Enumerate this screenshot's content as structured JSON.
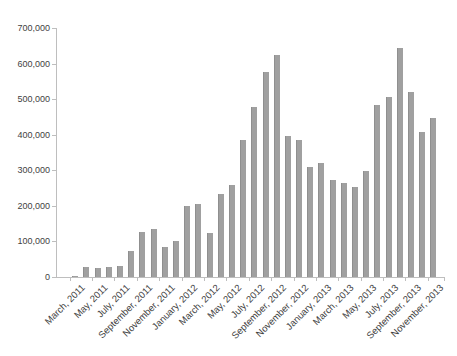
{
  "figure": {
    "background_color": "#ffffff",
    "bar_color": "#a0a0a0",
    "bar_border_color": "#8f8f8f",
    "axis_line_color": "#bebebe",
    "label_color": "#3f3f3f"
  },
  "chart_data": {
    "type": "bar",
    "title": "",
    "xlabel": "",
    "ylabel": "",
    "ylim": [
      0,
      700000
    ],
    "y_tick_interval": 100000,
    "y_tick_labels": [
      "0",
      "100,000",
      "200,000",
      "300,000",
      "400,000",
      "500,000",
      "600,000",
      "700,000"
    ],
    "grid": false,
    "legend": false,
    "x_label_every_n": 2,
    "x_labels_rotation_deg": 45,
    "visible_x_tick_labels": [
      "March, 2011",
      "May, 2011",
      "July, 2011",
      "September, 2011",
      "November, 2011",
      "January, 2012",
      "March, 2012",
      "May, 2012",
      "July, 2012",
      "September, 2012",
      "November, 2012",
      "January, 2013",
      "March, 2013",
      "May, 2013",
      "July, 2013",
      "September, 2013",
      "November, 2013"
    ],
    "categories": [
      "March, 2011",
      "April, 2011",
      "May, 2011",
      "June, 2011",
      "July, 2011",
      "August, 2011",
      "September, 2011",
      "October, 2011",
      "November, 2011",
      "December, 2011",
      "January, 2012",
      "February, 2012",
      "March, 2012",
      "April, 2012",
      "May, 2012",
      "June, 2012",
      "July, 2012",
      "August, 2012",
      "September, 2012",
      "October, 2012",
      "November, 2012",
      "December, 2012",
      "January, 2013",
      "February, 2013",
      "March, 2013",
      "April, 2013",
      "May, 2013",
      "June, 2013",
      "July, 2013",
      "August, 2013",
      "September, 2013",
      "October, 2013",
      "November, 2013"
    ],
    "values": [
      4000,
      28000,
      25000,
      28000,
      31000,
      73000,
      127000,
      135000,
      85000,
      101000,
      201000,
      206000,
      124000,
      232000,
      260000,
      385000,
      477000,
      577000,
      625000,
      397000,
      385000,
      308000,
      320000,
      274000,
      264000,
      253000,
      297000,
      484000,
      505000,
      645000,
      519000,
      408000,
      447000
    ]
  }
}
